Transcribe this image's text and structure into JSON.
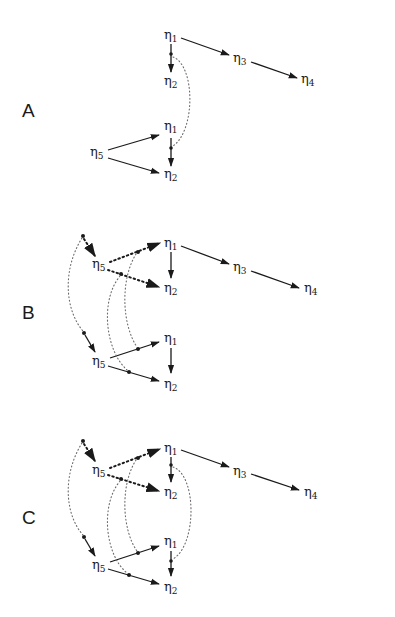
{
  "figure": {
    "panels": [
      {
        "id": "A",
        "label": "A",
        "nodes": {
          "upper_eta1": {
            "symbol": "η",
            "index": "1"
          },
          "upper_eta2": {
            "symbol": "η",
            "index": "2"
          },
          "eta3": {
            "symbol": "η",
            "index": "3"
          },
          "eta4": {
            "symbol": "η",
            "index": "4"
          },
          "lower_eta1": {
            "symbol": "η",
            "index": "1"
          },
          "lower_eta2": {
            "symbol": "η",
            "index": "2"
          },
          "lower_eta5": {
            "symbol": "η",
            "index": "5"
          }
        },
        "edges": [
          "η1→η2 (upper, solid, with dot)",
          "η1→η3 (solid)",
          "η3→η4 (solid)",
          "η5→η1 (lower, solid)",
          "η5→η2 (lower, solid)",
          "η1→η2 (lower, solid, with dot)",
          "dotted arc linking upper η1→η2 dot and lower η1→η2 dot"
        ]
      },
      {
        "id": "B",
        "label": "B",
        "nodes": {
          "upper_eta1": {
            "symbol": "η",
            "index": "1"
          },
          "upper_eta2": {
            "symbol": "η",
            "index": "2"
          },
          "upper_eta5": {
            "symbol": "η",
            "index": "5"
          },
          "eta3": {
            "symbol": "η",
            "index": "3"
          },
          "eta4": {
            "symbol": "η",
            "index": "4"
          },
          "lower_eta1": {
            "symbol": "η",
            "index": "1"
          },
          "lower_eta2": {
            "symbol": "η",
            "index": "2"
          },
          "lower_eta5": {
            "symbol": "η",
            "index": "5"
          }
        },
        "edges": [
          "dot→η5 (upper, heavy dotted)",
          "η5→η1 (upper, heavy dotted, with dot)",
          "η5→η2 (upper, heavy dotted, with dot)",
          "η1→η2 (upper, solid)",
          "η1→η3 (solid)",
          "η3→η4 (solid)",
          "dot→η5 (lower, solid)",
          "η5→η1 (lower, solid, with dot)",
          "η5→η2 (lower, solid, with dot)",
          "η1→η2 (lower, solid)",
          "three light dotted arcs linking upper and lower dots"
        ]
      },
      {
        "id": "C",
        "label": "C",
        "nodes": {
          "upper_eta1": {
            "symbol": "η",
            "index": "1"
          },
          "upper_eta2": {
            "symbol": "η",
            "index": "2"
          },
          "upper_eta5": {
            "symbol": "η",
            "index": "5"
          },
          "eta3": {
            "symbol": "η",
            "index": "3"
          },
          "eta4": {
            "symbol": "η",
            "index": "4"
          },
          "lower_eta1": {
            "symbol": "η",
            "index": "1"
          },
          "lower_eta2": {
            "symbol": "η",
            "index": "2"
          },
          "lower_eta5": {
            "symbol": "η",
            "index": "5"
          }
        },
        "edges": [
          "dot→η5 (upper, heavy dotted)",
          "η5→η1 (upper, heavy dotted, with dot)",
          "η5→η2 (upper, heavy dotted, with dot)",
          "η1→η2 (upper, solid, with dot)",
          "η1→η3 (solid)",
          "η3→η4 (solid)",
          "dot→η5 (lower, solid)",
          "η5→η1 (lower, solid, with dot)",
          "η5→η2 (lower, solid, with dot)",
          "η1→η2 (lower, solid, with dot)",
          "four light dotted arcs linking upper and lower dots"
        ]
      }
    ]
  }
}
